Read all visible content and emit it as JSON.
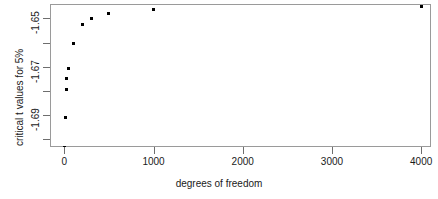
{
  "chart_data": {
    "type": "scatter",
    "title": "",
    "xlabel": "degrees of freedom",
    "ylabel": "critical t values for 5%",
    "xlim": [
      -160,
      4110
    ],
    "ylim": [
      -1.7032,
      -1.644
    ],
    "grid": false,
    "legend": null,
    "x": [
      5,
      10,
      20,
      30,
      50,
      100,
      200,
      300,
      500,
      1000,
      4000
    ],
    "y": [
      -1.7033,
      -1.6909,
      -1.6794,
      -1.6749,
      -1.6706,
      -1.6602,
      -1.6525,
      -1.65,
      -1.6479,
      -1.6464,
      -1.6452
    ],
    "points": [
      {
        "x": 5,
        "y": -1.7033
      },
      {
        "x": 10,
        "y": -1.6909
      },
      {
        "x": 20,
        "y": -1.6794
      },
      {
        "x": 30,
        "y": -1.6749
      },
      {
        "x": 50,
        "y": -1.6706
      },
      {
        "x": 100,
        "y": -1.6602
      },
      {
        "x": 200,
        "y": -1.6525
      },
      {
        "x": 300,
        "y": -1.65
      },
      {
        "x": 500,
        "y": -1.6479
      },
      {
        "x": 1000,
        "y": -1.6464
      },
      {
        "x": 4000,
        "y": -1.6452
      }
    ],
    "xticks": [
      {
        "value": 0,
        "label": "0"
      },
      {
        "value": 1000,
        "label": "1000"
      },
      {
        "value": 2000,
        "label": "2000"
      },
      {
        "value": 3000,
        "label": "3000"
      },
      {
        "value": 4000,
        "label": "4000"
      }
    ],
    "yticks": [
      {
        "value": -1.65,
        "label": "-1.65"
      },
      {
        "value": -1.66,
        "label": ""
      },
      {
        "value": -1.67,
        "label": "-1.67"
      },
      {
        "value": -1.68,
        "label": ""
      },
      {
        "value": -1.69,
        "label": "-1.69"
      },
      {
        "value": -1.7,
        "label": ""
      }
    ],
    "marker": {
      "shape": "square",
      "color": "#000000",
      "size": 3
    },
    "frame_color": "#9a9a9a"
  },
  "axes": {
    "x_title": "degrees of freedom",
    "y_title": "critical t values for 5%"
  }
}
